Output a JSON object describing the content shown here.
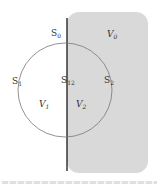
{
  "diagram": {
    "region": {
      "fill": "#d9d9d9",
      "edge_color": "#1a1a1a",
      "x": 67,
      "y": 12,
      "width": 81,
      "height": 161,
      "radius": 12
    },
    "circle": {
      "cx": 65,
      "cy": 90,
      "r": 47,
      "stroke": "#777777"
    },
    "labels": [
      {
        "id": "S0",
        "base": "S",
        "sub": "0",
        "x": 51,
        "y": 36,
        "italic": false
      },
      {
        "id": "V0",
        "base": "V",
        "sub": "0",
        "x": 107,
        "y": 37,
        "italic": true
      },
      {
        "id": "S1",
        "base": "S",
        "sub": "1",
        "x": 12,
        "y": 84,
        "italic": false
      },
      {
        "id": "S12",
        "base": "S",
        "sub": "12",
        "x": 61,
        "y": 83,
        "italic": false
      },
      {
        "id": "S2",
        "base": "S",
        "sub": "2",
        "x": 104,
        "y": 83,
        "italic": false
      },
      {
        "id": "V1",
        "base": "V",
        "sub": "1",
        "x": 39,
        "y": 107,
        "italic": true
      },
      {
        "id": "V2",
        "base": "V",
        "sub": "2",
        "x": 76,
        "y": 107,
        "italic": true
      }
    ]
  }
}
